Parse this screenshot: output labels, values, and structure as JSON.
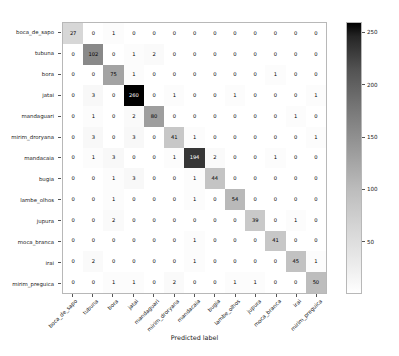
{
  "chart_data": {
    "type": "heatmap",
    "title": "",
    "xlabel": "Predicted label",
    "ylabel": "",
    "colormap": "Greys",
    "grid": false,
    "legend_position": "right-colorbar",
    "colorbar": {
      "ticks": [
        50,
        100,
        150,
        200,
        250
      ],
      "vmin": 0,
      "vmax": 260
    },
    "categories": [
      "boca_de_sapo",
      "tubuna",
      "bora",
      "jatai",
      "mandaguari",
      "mirim_droryana",
      "mandacaia",
      "bugia",
      "lambe_olhos",
      "jupura",
      "moca_branca",
      "irai",
      "mirim_preguica"
    ],
    "x_tick_labels": [
      "boca_de_sapo",
      "tubuna",
      "bora",
      "jatai",
      "mandaguari",
      "mirim_droryana",
      "mandacaia",
      "bugia",
      "lambe_olhos",
      "jupura",
      "moca_branca",
      "irai",
      "mirim_preguica"
    ],
    "y_tick_labels": [
      "boca_de_sapo",
      "tubuna",
      "bora",
      "jatai",
      "mandaguari",
      "mirim_droryana",
      "mandacaia",
      "bugia",
      "lambe_olhos",
      "jupura",
      "moca_branca",
      "irai",
      "mirim_preguica"
    ],
    "matrix": [
      [
        27,
        0,
        1,
        0,
        0,
        0,
        0,
        0,
        0,
        0,
        0,
        0,
        0
      ],
      [
        0,
        102,
        0,
        1,
        2,
        0,
        0,
        0,
        0,
        0,
        0,
        0,
        0
      ],
      [
        0,
        0,
        75,
        1,
        0,
        0,
        0,
        0,
        0,
        0,
        1,
        0,
        0
      ],
      [
        0,
        3,
        0,
        260,
        0,
        1,
        0,
        0,
        1,
        0,
        0,
        0,
        1
      ],
      [
        0,
        1,
        0,
        2,
        80,
        0,
        0,
        0,
        0,
        0,
        0,
        1,
        0
      ],
      [
        0,
        3,
        0,
        3,
        0,
        41,
        1,
        0,
        0,
        0,
        0,
        0,
        1
      ],
      [
        0,
        1,
        3,
        0,
        0,
        1,
        194,
        2,
        0,
        0,
        1,
        0,
        0
      ],
      [
        0,
        0,
        1,
        3,
        0,
        0,
        1,
        44,
        0,
        0,
        0,
        0,
        0
      ],
      [
        0,
        0,
        1,
        0,
        0,
        0,
        1,
        0,
        54,
        0,
        0,
        0,
        0
      ],
      [
        0,
        0,
        2,
        0,
        0,
        0,
        0,
        0,
        0,
        39,
        0,
        1,
        0
      ],
      [
        0,
        0,
        0,
        0,
        0,
        0,
        1,
        0,
        0,
        0,
        41,
        0,
        0
      ],
      [
        0,
        2,
        0,
        0,
        0,
        0,
        1,
        0,
        0,
        0,
        0,
        45,
        1
      ],
      [
        0,
        0,
        1,
        1,
        0,
        2,
        0,
        0,
        1,
        1,
        0,
        0,
        50
      ]
    ]
  }
}
